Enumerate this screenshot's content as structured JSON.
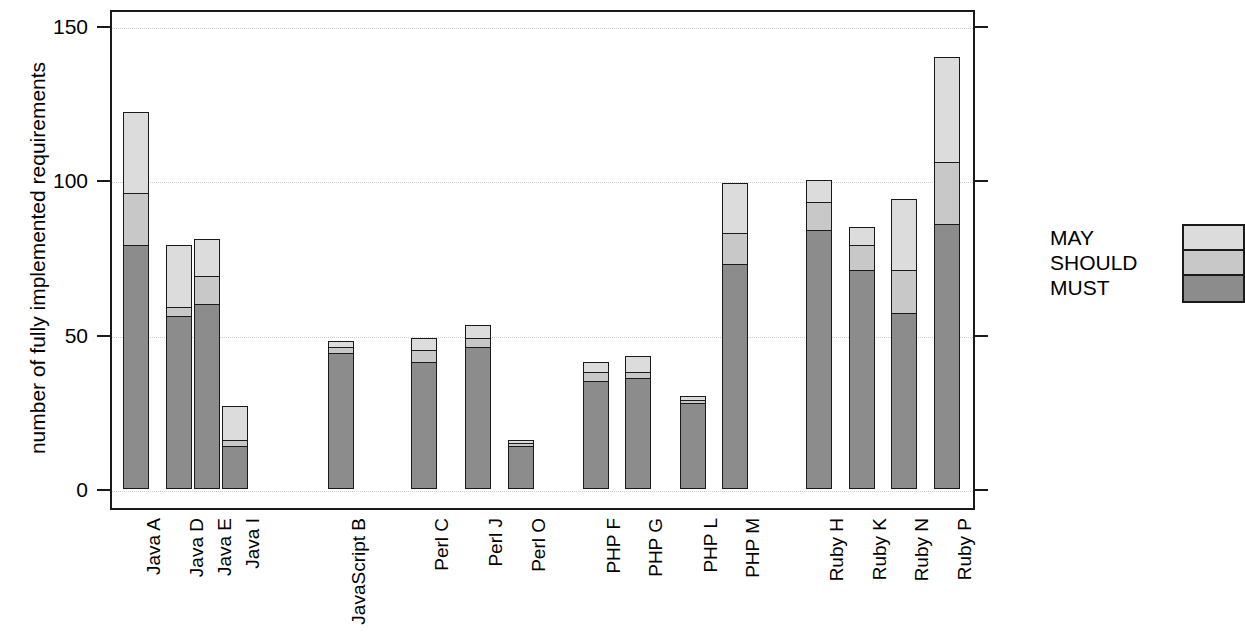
{
  "chart_data": {
    "type": "bar",
    "subtype": "stacked-bar",
    "title": "",
    "xlabel": "",
    "ylabel": "number of fully implemented requirements",
    "ylim": [
      0,
      155
    ],
    "yticks": [
      0,
      50,
      100,
      150
    ],
    "ytick_labels": [
      "0",
      "50",
      "100",
      "150"
    ],
    "grid": "horizontal-dotted",
    "legend_position": "right",
    "categories": [
      "Java A",
      "Java D",
      "Java E",
      "Java I",
      "JavaScript B",
      "Perl C",
      "Perl J",
      "Perl O",
      "PHP F",
      "PHP G",
      "PHP L",
      "PHP M",
      "Ruby H",
      "Ruby K",
      "Ruby N",
      "Ruby P"
    ],
    "groups": [
      {
        "name": "Java",
        "members": [
          "Java A",
          "Java D",
          "Java E",
          "Java I"
        ]
      },
      {
        "name": "JavaScript",
        "members": [
          "JavaScript B"
        ]
      },
      {
        "name": "Perl",
        "members": [
          "Perl C",
          "Perl J",
          "Perl O"
        ]
      },
      {
        "name": "PHP",
        "members": [
          "PHP F",
          "PHP G",
          "PHP L",
          "PHP M"
        ]
      },
      {
        "name": "Ruby",
        "members": [
          "Ruby H",
          "Ruby K",
          "Ruby N",
          "Ruby P"
        ]
      }
    ],
    "series": [
      {
        "name": "MUST",
        "color": "#8c8c8c",
        "values": [
          79,
          56,
          60,
          14,
          44,
          41,
          46,
          14,
          35,
          36,
          28,
          73,
          84,
          71,
          57,
          86
        ]
      },
      {
        "name": "SHOULD",
        "color": "#c8c8c8",
        "values": [
          17,
          3,
          9,
          2,
          2,
          4,
          3,
          1,
          3,
          2,
          1,
          10,
          9,
          8,
          14,
          20
        ]
      },
      {
        "name": "MAY",
        "color": "#dcdcdc",
        "values": [
          26,
          20,
          12,
          11,
          2,
          4,
          4,
          1,
          3,
          5,
          1,
          16,
          7,
          6,
          23,
          34
        ]
      }
    ],
    "totals": [
      122,
      79,
      81,
      27,
      48,
      49,
      53,
      16,
      41,
      43,
      30,
      99,
      100,
      85,
      94,
      140
    ],
    "legend_entries": [
      "MAY",
      "SHOULD",
      "MUST"
    ]
  },
  "legend": {
    "items": [
      {
        "label": "MAY",
        "color": "#dcdcdc"
      },
      {
        "label": "SHOULD",
        "color": "#c8c8c8"
      },
      {
        "label": "MUST",
        "color": "#8c8c8c"
      }
    ]
  },
  "axes": {
    "y_title": "number of fully implemented requirements",
    "y_tick_0": "0",
    "y_tick_1": "50",
    "y_tick_2": "100",
    "y_tick_3": "150"
  }
}
